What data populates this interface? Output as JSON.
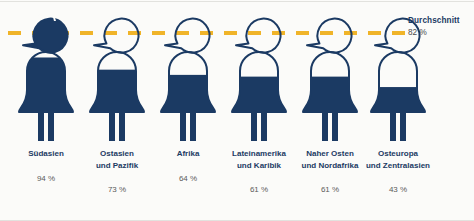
{
  "theme": {
    "background": "#fbfbf9",
    "figure_fill": "#1b3a63",
    "figure_outline": "#1b3a63",
    "dash_color": "#f0b429",
    "label_color": "#1b3a63",
    "value_color": "#5a5a5a"
  },
  "average": {
    "label": "Durchschnitt",
    "value": "82 %",
    "value_number": 82
  },
  "chart_data": {
    "type": "bar",
    "subtype": "pictogram-fill",
    "title": "Durchschnitt",
    "xlabel": "",
    "ylabel": "",
    "ylim": [
      0,
      100
    ],
    "unit": "%",
    "grid": false,
    "legend_position": "right",
    "reference_line": {
      "label": "Durchschnitt",
      "value": 82,
      "value_text": "82 %",
      "style": "dashed",
      "color": "#f0b429"
    },
    "categories": [
      "Südasien",
      "Ostasien und Pazifik",
      "Afrika",
      "Lateinamerika und Karibik",
      "Naher Osten und Nordafrika",
      "Osteuropa und Zentralasien"
    ],
    "values": [
      94,
      73,
      64,
      61,
      61,
      43
    ],
    "value_labels": [
      "94 %",
      "73 %",
      "64 %",
      "61 %",
      "61 %",
      "43 %"
    ]
  },
  "figures": [
    {
      "id": "figure-suedasien",
      "name_lines": "Südasien",
      "value": 94,
      "value_label": "94 %",
      "fill_ratio": 0.94,
      "head_filled": true
    },
    {
      "id": "figure-ostasien-und-pazifik",
      "name_lines": "Ostasien\nund Pazifik",
      "value": 73,
      "value_label": "73 %",
      "fill_ratio": 0.73,
      "head_filled": false
    },
    {
      "id": "figure-afrika",
      "name_lines": "Afrika",
      "value": 64,
      "value_label": "64 %",
      "fill_ratio": 0.64,
      "head_filled": false
    },
    {
      "id": "figure-lateinamerika-und-karibik",
      "name_lines": "Lateinamerika\nund Karibik",
      "value": 61,
      "value_label": "61 %",
      "fill_ratio": 0.61,
      "head_filled": false
    },
    {
      "id": "figure-naher-osten-und-nordafrika",
      "name_lines": "Naher Osten\nund Nordafrika",
      "value": 61,
      "value_label": "61 %",
      "fill_ratio": 0.61,
      "head_filled": false
    },
    {
      "id": "figure-osteuropa-und-zentralasien",
      "name_lines": "Osteuropa\nund Zentralasien",
      "value": 43,
      "value_label": "43 %",
      "fill_ratio": 0.43,
      "head_filled": false
    }
  ]
}
